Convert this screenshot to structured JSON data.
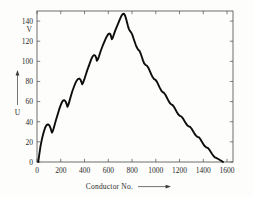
{
  "chart_data": {
    "type": "line",
    "title": "",
    "xlabel": "Conductor No.",
    "ylabel": "U",
    "yunit": "V",
    "xlim": [
      0,
      1650
    ],
    "ylim": [
      0,
      150
    ],
    "grid": false,
    "legend": null,
    "x_ticks": [
      0,
      200,
      400,
      600,
      800,
      1000,
      1200,
      1400,
      1600
    ],
    "x_tick_labels": [
      "0",
      "200",
      "400",
      "600",
      "800",
      "1000",
      "1200",
      "1400",
      "1600"
    ],
    "y_ticks": [
      0,
      20,
      40,
      60,
      80,
      100,
      120,
      140
    ],
    "y_tick_labels": [
      "0",
      "20",
      "40",
      "60",
      "80",
      "100",
      "120",
      "140"
    ],
    "series": [
      {
        "name": "U",
        "color": "#0d0d0d",
        "points": [
          [
            10,
            0
          ],
          [
            20,
            8
          ],
          [
            30,
            16
          ],
          [
            42,
            23
          ],
          [
            55,
            29
          ],
          [
            68,
            34
          ],
          [
            80,
            36.6
          ],
          [
            92,
            37.4
          ],
          [
            104,
            36.5
          ],
          [
            113,
            34
          ],
          [
            120,
            31.2
          ],
          [
            126,
            29.2
          ],
          [
            134,
            31
          ],
          [
            144,
            35
          ],
          [
            158,
            41
          ],
          [
            172,
            46.5
          ],
          [
            186,
            52
          ],
          [
            198,
            56
          ],
          [
            210,
            59.4
          ],
          [
            220,
            61.2
          ],
          [
            232,
            61.4
          ],
          [
            242,
            59.8
          ],
          [
            250,
            57.3
          ],
          [
            256,
            54.8
          ],
          [
            263,
            56.5
          ],
          [
            272,
            60
          ],
          [
            284,
            65
          ],
          [
            298,
            70.5
          ],
          [
            312,
            75
          ],
          [
            324,
            78.6
          ],
          [
            336,
            81.2
          ],
          [
            346,
            82.6
          ],
          [
            356,
            82.9
          ],
          [
            366,
            81.8
          ],
          [
            374,
            79.4
          ],
          [
            380,
            77.2
          ],
          [
            388,
            78.8
          ],
          [
            398,
            82
          ],
          [
            410,
            86.5
          ],
          [
            424,
            91.5
          ],
          [
            438,
            96
          ],
          [
            450,
            100
          ],
          [
            460,
            103
          ],
          [
            470,
            105.2
          ],
          [
            480,
            106.2
          ],
          [
            490,
            105.7
          ],
          [
            498,
            103.6
          ],
          [
            504,
            100.6
          ],
          [
            512,
            101.8
          ],
          [
            522,
            105
          ],
          [
            534,
            109.5
          ],
          [
            548,
            114
          ],
          [
            562,
            118
          ],
          [
            574,
            121.4
          ],
          [
            584,
            124
          ],
          [
            594,
            126
          ],
          [
            602,
            127.2
          ],
          [
            610,
            127.6
          ],
          [
            618,
            126.8
          ],
          [
            624,
            124.6
          ],
          [
            630,
            122
          ],
          [
            638,
            123.5
          ],
          [
            648,
            127
          ],
          [
            660,
            131
          ],
          [
            674,
            135
          ],
          [
            688,
            139
          ],
          [
            700,
            142.4
          ],
          [
            710,
            145
          ],
          [
            718,
            146.6
          ],
          [
            726,
            147.3
          ],
          [
            734,
            147
          ],
          [
            742,
            145.3
          ],
          [
            750,
            142.2
          ],
          [
            758,
            138.6
          ],
          [
            766,
            135
          ],
          [
            774,
            132
          ],
          [
            782,
            130.2
          ],
          [
            792,
            128.8
          ],
          [
            802,
            126.5
          ],
          [
            812,
            123
          ],
          [
            822,
            119.5
          ],
          [
            832,
            116.2
          ],
          [
            842,
            113.4
          ],
          [
            852,
            111.6
          ],
          [
            862,
            110.6
          ],
          [
            872,
            108
          ],
          [
            882,
            104.5
          ],
          [
            892,
            101
          ],
          [
            902,
            98
          ],
          [
            914,
            96.4
          ],
          [
            926,
            95.6
          ],
          [
            938,
            93.4
          ],
          [
            950,
            90.2
          ],
          [
            962,
            87
          ],
          [
            974,
            84.2
          ],
          [
            986,
            82.4
          ],
          [
            998,
            81.6
          ],
          [
            1010,
            79.6
          ],
          [
            1022,
            76.6
          ],
          [
            1034,
            73.6
          ],
          [
            1046,
            71
          ],
          [
            1058,
            69.4
          ],
          [
            1070,
            68.6
          ],
          [
            1082,
            66.6
          ],
          [
            1094,
            63.8
          ],
          [
            1106,
            61
          ],
          [
            1118,
            58.6
          ],
          [
            1130,
            57.2
          ],
          [
            1142,
            56.5
          ],
          [
            1154,
            54.6
          ],
          [
            1166,
            52
          ],
          [
            1178,
            49.4
          ],
          [
            1190,
            47.2
          ],
          [
            1202,
            45.9
          ],
          [
            1216,
            45.2
          ],
          [
            1228,
            43.4
          ],
          [
            1240,
            41
          ],
          [
            1252,
            38.6
          ],
          [
            1264,
            36.6
          ],
          [
            1276,
            35.4
          ],
          [
            1290,
            34.8
          ],
          [
            1302,
            33
          ],
          [
            1314,
            30.6
          ],
          [
            1326,
            28.2
          ],
          [
            1338,
            26.2
          ],
          [
            1350,
            25
          ],
          [
            1364,
            24.4
          ],
          [
            1376,
            22.6
          ],
          [
            1388,
            20.2
          ],
          [
            1400,
            17.8
          ],
          [
            1412,
            15.8
          ],
          [
            1424,
            14.6
          ],
          [
            1438,
            14
          ],
          [
            1450,
            12.4
          ],
          [
            1462,
            10.2
          ],
          [
            1474,
            8
          ],
          [
            1486,
            6
          ],
          [
            1498,
            4.6
          ],
          [
            1512,
            3.8
          ],
          [
            1526,
            3
          ],
          [
            1540,
            2
          ],
          [
            1554,
            1
          ],
          [
            1566,
            0
          ]
        ]
      }
    ],
    "annotations": {
      "y_axis_arrow": "up-arrow",
      "x_axis_arrow": "right-arrow"
    }
  },
  "figure": {
    "y_axis_label": "U",
    "y_axis_unit": "V",
    "x_axis_label": "Conductor No."
  }
}
